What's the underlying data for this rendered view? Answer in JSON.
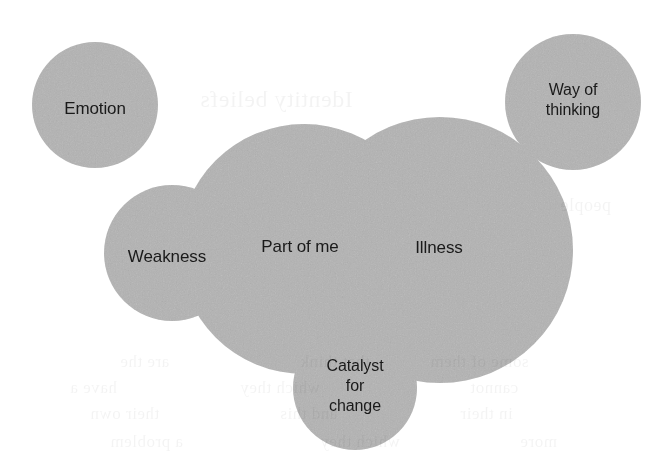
{
  "figure": {
    "type": "venn-diagram",
    "background_color": "#ffffff",
    "circle_fill_color": "#b3b3b3",
    "overlap_fill_color": "#949494",
    "label_color": "#1a1a1a"
  },
  "sets": [
    {
      "id": "emotion",
      "label": "Emotion",
      "cx": 95,
      "cy": 105,
      "r": 63,
      "label_x": 95,
      "label_y": 108
    },
    {
      "id": "way-of-thinking",
      "label": "Way of\nthinking",
      "cx": 573,
      "cy": 102,
      "r": 68,
      "label_x": 573,
      "label_y": 100
    },
    {
      "id": "weakness",
      "label": "Weakness",
      "cx": 172,
      "cy": 253,
      "r": 68,
      "label_x": 167,
      "label_y": 256
    },
    {
      "id": "part-of-me",
      "label": "Part of me",
      "cx": 304,
      "cy": 249,
      "r": 125,
      "label_x": 300,
      "label_y": 246
    },
    {
      "id": "illness",
      "label": "Illness",
      "cx": 440,
      "cy": 250,
      "r": 133,
      "label_x": 439,
      "label_y": 247
    },
    {
      "id": "catalyst-for-change",
      "label": "Catalyst\nfor\nchange",
      "cx": 355,
      "cy": 388,
      "r": 62,
      "label_x": 355,
      "label_y": 386
    }
  ],
  "background_bleed": [
    {
      "text": "Identity beliefs",
      "x": 200,
      "y": 86,
      "size": 24
    },
    {
      "text": "people",
      "x": 560,
      "y": 195,
      "size": 18
    },
    {
      "text": "are the",
      "x": 120,
      "y": 352,
      "size": 17
    },
    {
      "text": "that think",
      "x": 300,
      "y": 352,
      "size": 17
    },
    {
      "text": "some of them",
      "x": 430,
      "y": 352,
      "size": 17
    },
    {
      "text": "have a",
      "x": 70,
      "y": 378,
      "size": 17
    },
    {
      "text": "which they",
      "x": 240,
      "y": 378,
      "size": 17
    },
    {
      "text": "cannot",
      "x": 470,
      "y": 378,
      "size": 17
    },
    {
      "text": "their own",
      "x": 90,
      "y": 404,
      "size": 17
    },
    {
      "text": "and this",
      "x": 280,
      "y": 404,
      "size": 17
    },
    {
      "text": "in their",
      "x": 460,
      "y": 404,
      "size": 17
    },
    {
      "text": "a problem",
      "x": 110,
      "y": 432,
      "size": 17
    },
    {
      "text": "which they",
      "x": 320,
      "y": 432,
      "size": 17
    },
    {
      "text": "more",
      "x": 520,
      "y": 432,
      "size": 17
    }
  ]
}
